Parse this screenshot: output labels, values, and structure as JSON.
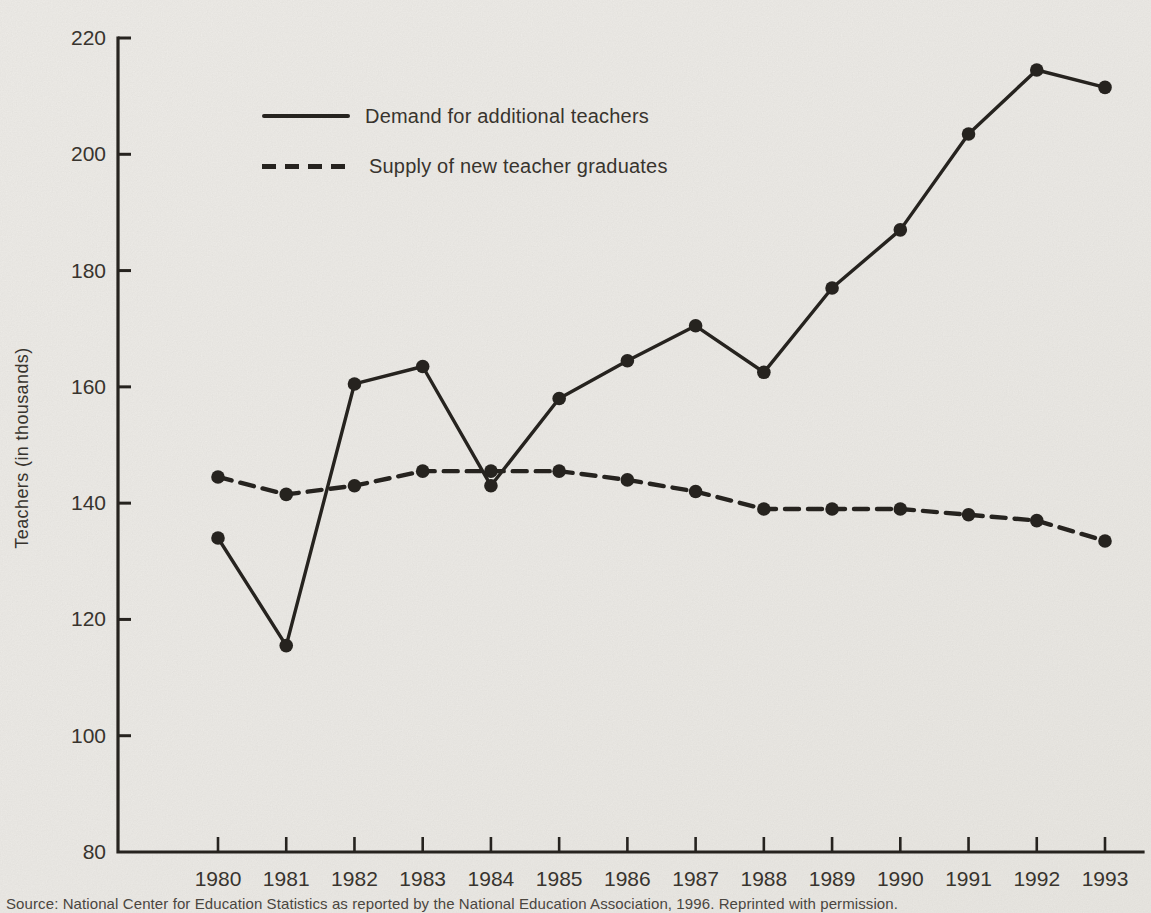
{
  "colors": {
    "ink": "#26231f",
    "text": "#38342e",
    "paper": "#f1efeb"
  },
  "chart_data": {
    "type": "line",
    "x": [
      1980,
      1981,
      1982,
      1983,
      1984,
      1985,
      1986,
      1987,
      1988,
      1989,
      1990,
      1991,
      1992,
      1993
    ],
    "series": [
      {
        "name": "Demand for additional teachers",
        "line_style": "solid",
        "marker": "filled-circle",
        "values": [
          134,
          115.5,
          160.5,
          163.5,
          143,
          158,
          164.5,
          170.5,
          162.5,
          177,
          187,
          203.5,
          214.5,
          211.5
        ]
      },
      {
        "name": "Supply of new teacher graduates",
        "line_style": "dashed",
        "marker": "filled-circle",
        "values": [
          144.5,
          141.5,
          143,
          145.5,
          145.5,
          145.5,
          144,
          142,
          139,
          139,
          139,
          138,
          137,
          133.5
        ]
      }
    ],
    "title": "",
    "xlabel": "",
    "ylabel": "Teachers (in thousands)",
    "ylim": [
      80,
      220
    ],
    "yticks": [
      80,
      100,
      120,
      140,
      160,
      180,
      200,
      220
    ],
    "grid": false,
    "legend_position": "top-left-inside"
  },
  "source_note": "Source: National Center for Education Statistics as reported by the National Education Association, 1996.  Reprinted with permission."
}
